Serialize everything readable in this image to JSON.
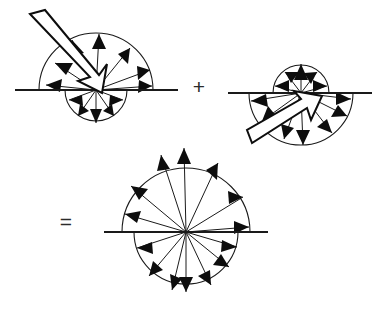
{
  "figure": {
    "line_color": "#1a1a1a",
    "fill_color": "#0d0d0d",
    "background": "#ffffff",
    "operators": [
      {
        "id": "plus",
        "symbol": "+",
        "x": 199,
        "y": 88
      },
      {
        "id": "equals",
        "symbol": "=",
        "x": 66,
        "y": 223
      }
    ],
    "panels": [
      {
        "id": "panel-left",
        "name": "upper-dominant-lobe-pattern",
        "center": {
          "x": 96,
          "y": 90
        },
        "baseline": {
          "x1": 15,
          "x2": 178,
          "y": 90
        },
        "upper_lobe": {
          "radius": 57,
          "ray_count": 7,
          "direction": "outward"
        },
        "lower_lobe": {
          "radius": 31,
          "ray_count": 5,
          "direction": "outward"
        },
        "incident_arrow": {
          "from": {
            "x": 30,
            "y": 14
          },
          "to": {
            "x": 94,
            "y": 88
          },
          "style": "hollow-block",
          "direction": "down-right"
        }
      },
      {
        "id": "panel-right",
        "name": "lower-dominant-lobe-pattern",
        "center": {
          "x": 301,
          "y": 93
        },
        "baseline": {
          "x1": 228,
          "x2": 372,
          "y": 93
        },
        "upper_lobe": {
          "radius": 28,
          "ray_count": 5,
          "direction": "outward"
        },
        "lower_lobe": {
          "radius": 52,
          "ray_count": 7,
          "direction": "outward"
        },
        "incident_arrow": {
          "from": {
            "x": 252,
            "y": 143
          },
          "to": {
            "x": 303,
            "y": 95
          },
          "style": "hollow-block",
          "direction": "up-right"
        }
      },
      {
        "id": "panel-result",
        "name": "isotropic-full-circle-pattern",
        "center": {
          "x": 186,
          "y": 232
        },
        "baseline": {
          "x1": 104,
          "x2": 268,
          "y": 232
        },
        "upper_lobe": {
          "radius": 64,
          "ray_count": 7,
          "direction": "outward"
        },
        "lower_lobe": {
          "radius": 52,
          "ray_count": 7,
          "direction": "outward"
        },
        "incident_arrow": null
      }
    ]
  }
}
